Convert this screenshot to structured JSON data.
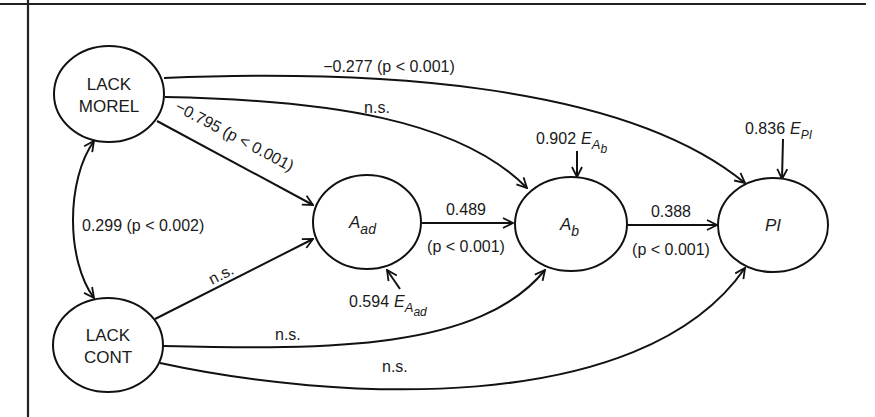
{
  "diagram": {
    "type": "path-diagram",
    "colors": {
      "stroke": "#111111",
      "text": "#1a1a1a",
      "background": "#ffffff"
    },
    "nodes": {
      "lack_morel": {
        "line1": "LACK",
        "line2": "MOREL"
      },
      "lack_cont": {
        "line1": "LACK",
        "line2": "CONT"
      },
      "a_ad": {
        "main": "A",
        "sub": "ad"
      },
      "a_b": {
        "main": "A",
        "sub": "b"
      },
      "pi": {
        "main": "PI"
      }
    },
    "edges": {
      "morel_to_pi": {
        "label": "−0.277 (p < 0.001)"
      },
      "morel_to_ab": {
        "label": "n.s."
      },
      "morel_to_aad": {
        "label": "−0.795 (p < 0.001)"
      },
      "morel_cont_covariance": {
        "label": "0.299 (p < 0.002)"
      },
      "cont_to_aad": {
        "label": "n.s."
      },
      "cont_to_ab": {
        "label": "n.s."
      },
      "cont_to_pi": {
        "label": "n.s."
      },
      "aad_to_ab": {
        "value": "0.489",
        "p": "(p < 0.001)"
      },
      "ab_to_pi": {
        "value": "0.388",
        "p": "(p < 0.001)"
      }
    },
    "errors": {
      "e_aad": {
        "coef": "0.594",
        "symbol": "E",
        "sub": "A",
        "subsub": "ad"
      },
      "e_ab": {
        "coef": "0.902",
        "symbol": "E",
        "sub": "A",
        "subsub": "b"
      },
      "e_pi": {
        "coef": "0.836",
        "symbol": "E",
        "sub": "PI"
      }
    }
  }
}
